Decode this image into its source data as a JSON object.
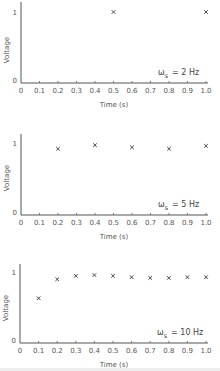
{
  "chart_data": [
    {
      "type": "scatter",
      "title": "",
      "annotation": "ω_s = 2 Hz",
      "xlabel": "Time (s)",
      "ylabel": "Voltage",
      "xlim": [
        0,
        1.0
      ],
      "ylim": [
        0,
        1
      ],
      "xticks": [
        "0",
        "0.1",
        "0.2",
        "0.3",
        "0.4",
        "0.5",
        "0.6",
        "0.7",
        "0.8",
        "0.9",
        "1.0"
      ],
      "yticks": [
        "0",
        "1"
      ],
      "grid": false,
      "marker": "x",
      "x": [
        0.5,
        1.0
      ],
      "y": [
        1.0,
        1.0
      ]
    },
    {
      "type": "scatter",
      "title": "",
      "annotation": "ω_s = 5 Hz",
      "xlabel": "Time (s)",
      "ylabel": "Voltage",
      "xlim": [
        0,
        1.0
      ],
      "ylim": [
        0,
        1
      ],
      "xticks": [
        "0",
        "0.1",
        "0.2",
        "0.3",
        "0.4",
        "0.5",
        "0.6",
        "0.7",
        "0.8",
        "0.9",
        "1.0"
      ],
      "yticks": [
        "0",
        "1"
      ],
      "grid": false,
      "marker": "x",
      "x": [
        0.2,
        0.4,
        0.6,
        0.8,
        1.0
      ],
      "y": [
        0.92,
        0.97,
        0.94,
        0.92,
        0.96
      ]
    },
    {
      "type": "scatter",
      "title": "",
      "annotation": "ω_s = 10 Hz",
      "xlabel": "Time (s)",
      "ylabel": "Voltage",
      "xlim": [
        0,
        1.0
      ],
      "ylim": [
        0,
        1
      ],
      "xticks": [
        "0",
        "0.1",
        "0.2",
        "0.3",
        "0.4",
        "0.5",
        "0.6",
        "0.7",
        "0.8",
        "0.9",
        "1.0"
      ],
      "yticks": [
        "0",
        "1"
      ],
      "grid": false,
      "marker": "x",
      "x": [
        0.1,
        0.2,
        0.3,
        0.4,
        0.5,
        0.6,
        0.7,
        0.8,
        0.9,
        1.0
      ],
      "y": [
        0.64,
        0.91,
        0.96,
        0.97,
        0.96,
        0.94,
        0.93,
        0.93,
        0.94,
        0.94
      ]
    }
  ],
  "panels": [
    {
      "omega": "ω",
      "sub": "s",
      "rate": "= 2 Hz",
      "xlabel": "Time (s)",
      "ylabel": "Voltage",
      "y1": "1",
      "y0": "0"
    },
    {
      "omega": "ω",
      "sub": "s",
      "rate": "= 5 Hz",
      "xlabel": "Time (s)",
      "ylabel": "Voltage",
      "y1": "1",
      "y0": "0"
    },
    {
      "omega": "ω",
      "sub": "s",
      "rate": "= 10 Hz",
      "xlabel": "Time (s)",
      "ylabel": "Voltage",
      "y1": "1",
      "y0": "0"
    }
  ]
}
